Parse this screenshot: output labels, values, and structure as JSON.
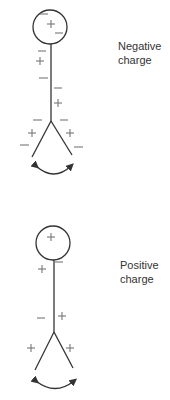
{
  "panels": [
    {
      "id": "negative",
      "label_line1": "Negative",
      "label_line2": "charge",
      "ball_charges": [
        "−",
        "+",
        "−"
      ],
      "stem_charges": [
        "−",
        "+",
        "−",
        "−",
        "+"
      ],
      "leaf_charges": [
        "−",
        "+",
        "−",
        "−",
        "+",
        "−"
      ]
    },
    {
      "id": "positive",
      "label_line1": "Positive",
      "label_line2": "charge",
      "ball_charges": [
        "+"
      ],
      "stem_charges": [
        "+",
        "−",
        "−",
        "+"
      ],
      "leaf_charges": [
        "+",
        "+"
      ]
    }
  ],
  "colors": {
    "line": "#333333",
    "charge": "#777777",
    "text": "#333333"
  }
}
